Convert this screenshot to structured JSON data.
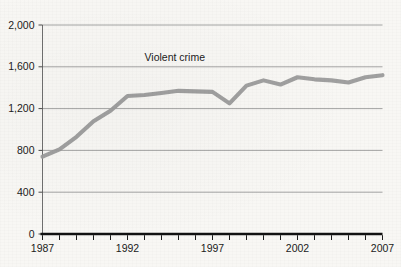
{
  "figure": {
    "clipped_header_text": "",
    "background_color": "#f8f7f4",
    "line_color": "#9b9b9b",
    "axis_color": "#111111",
    "grid_color": "#9a9a9a",
    "text_color": "#1b1b1b"
  },
  "chart_data": {
    "type": "line",
    "title": "",
    "xlabel": "",
    "ylabel": "",
    "xlim": [
      1987,
      2007
    ],
    "ylim": [
      0,
      2000
    ],
    "grid": true,
    "legend_position": "inline-annotation",
    "y_ticks": [
      0,
      400,
      800,
      1200,
      1600,
      2000
    ],
    "y_tick_labels": [
      "0",
      "400",
      "800",
      "1,200",
      "1,600",
      "2,000"
    ],
    "x_ticks": [
      1987,
      1988,
      1989,
      1990,
      1991,
      1992,
      1993,
      1994,
      1995,
      1996,
      1997,
      1998,
      1999,
      2000,
      2001,
      2002,
      2003,
      2004,
      2005,
      2006,
      2007
    ],
    "x_tick_labels_shown": [
      "1987",
      "1992",
      "1997",
      "2002",
      "2007"
    ],
    "x_tick_labels_shown_at": [
      1987,
      1992,
      1997,
      2002,
      2007
    ],
    "annotations": [
      {
        "text": "Violent crime",
        "x": 1993.0,
        "y": 1660
      }
    ],
    "series": [
      {
        "name": "Violent crime",
        "color": "#9b9b9b",
        "x": [
          1987,
          1988,
          1989,
          1990,
          1991,
          1992,
          1993,
          1994,
          1995,
          1996,
          1997,
          1998,
          1999,
          2000,
          2001,
          2002,
          2003,
          2004,
          2005,
          2006,
          2007
        ],
        "values": [
          740,
          810,
          930,
          1080,
          1180,
          1320,
          1330,
          1350,
          1370,
          1365,
          1360,
          1250,
          1420,
          1470,
          1430,
          1500,
          1480,
          1470,
          1450,
          1500,
          1520
        ]
      }
    ]
  }
}
